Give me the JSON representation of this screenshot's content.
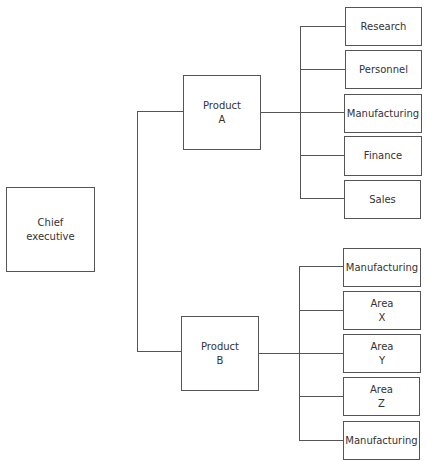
{
  "diagram": {
    "type": "organization-chart",
    "root": {
      "label_line1": "Chief",
      "label_line2": "executive"
    },
    "products": [
      {
        "label_line1": "Product",
        "label_line2": "A",
        "departments": [
          {
            "line1": "Research",
            "line2": ""
          },
          {
            "line1": "Personnel",
            "line2": ""
          },
          {
            "line1": "Manufacturing",
            "line2": ""
          },
          {
            "line1": "Finance",
            "line2": ""
          },
          {
            "line1": "Sales",
            "line2": ""
          }
        ]
      },
      {
        "label_line1": "Product",
        "label_line2": "B",
        "departments": [
          {
            "line1": "Manufacturing",
            "line2": ""
          },
          {
            "line1": "Area",
            "line2": "X"
          },
          {
            "line1": "Area",
            "line2": "Y"
          },
          {
            "line1": "Area",
            "line2": "Z"
          },
          {
            "line1": "Manufacturing",
            "line2": ""
          }
        ]
      }
    ],
    "colors": {
      "line": "#555555",
      "text": "#333333",
      "background": "#ffffff"
    }
  }
}
